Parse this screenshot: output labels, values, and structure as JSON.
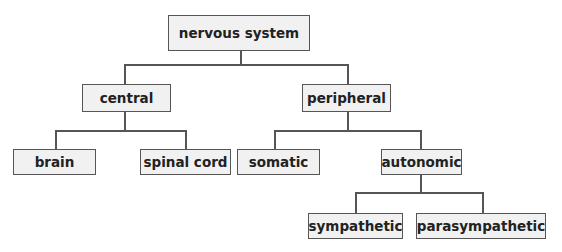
{
  "diagram": {
    "type": "tree",
    "title": "",
    "nodes": {
      "root": "nervous system",
      "central": "central",
      "peripheral": "peripheral",
      "brain": "brain",
      "spinal_cord": "spinal cord",
      "somatic": "somatic",
      "autonomic": "autonomic",
      "sympathetic": "sympathetic",
      "parasympathetic": "parasympathetic"
    },
    "edges": [
      [
        "nervous system",
        "central"
      ],
      [
        "nervous system",
        "peripheral"
      ],
      [
        "central",
        "brain"
      ],
      [
        "central",
        "spinal cord"
      ],
      [
        "peripheral",
        "somatic"
      ],
      [
        "peripheral",
        "autonomic"
      ],
      [
        "autonomic",
        "sympathetic"
      ],
      [
        "autonomic",
        "parasympathetic"
      ]
    ],
    "colors": {
      "box_fill": "#f1f1f1",
      "border": "#555555",
      "text": "#222222"
    }
  }
}
